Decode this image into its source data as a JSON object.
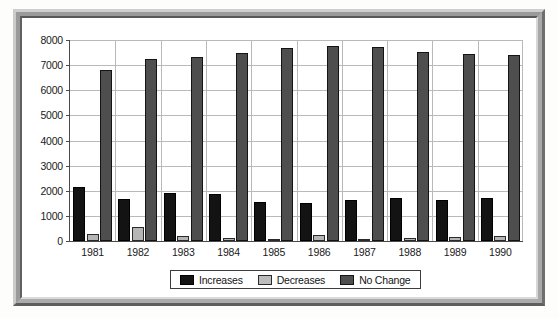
{
  "chart_data": {
    "type": "bar",
    "title": "",
    "subtitle": "",
    "xlabel": "",
    "ylabel": "",
    "ylim": [
      0,
      8000
    ],
    "ytick_step": 1000,
    "yticks": [
      "0",
      "1000",
      "2000",
      "3000",
      "4000",
      "5000",
      "6000",
      "7000",
      "8000"
    ],
    "grid": true,
    "legend_position": "bottom-center",
    "categories": [
      "1981",
      "1982",
      "1983",
      "1984",
      "1985",
      "1986",
      "1987",
      "1988",
      "1989",
      "1990"
    ],
    "series": [
      {
        "name": "Increases",
        "color": "#131313",
        "values": [
          2140,
          1670,
          1900,
          1870,
          1550,
          1500,
          1620,
          1700,
          1640,
          1700
        ]
      },
      {
        "name": "Decreases",
        "color": "#b5b5b5",
        "values": [
          270,
          550,
          180,
          130,
          100,
          250,
          80,
          120,
          150,
          180
        ]
      },
      {
        "name": "No Change",
        "color": "#4e4e4e",
        "values": [
          6820,
          7260,
          7320,
          7490,
          7690,
          7770,
          7730,
          7540,
          7440,
          7420
        ]
      }
    ]
  },
  "legend": {
    "items": [
      {
        "label": "Increases",
        "swatch": "legend-swatch-increases"
      },
      {
        "label": "Decreases",
        "swatch": "legend-swatch-decreases"
      },
      {
        "label": "No Change",
        "swatch": "legend-swatch-no-change"
      }
    ]
  },
  "colors": {
    "increases": "#131313",
    "decreases": "#b5b5b5",
    "no_change": "#4e4e4e",
    "gridline": "#b9b9b9",
    "axis": "#4a4a4a",
    "frame": "#9a9a9a",
    "background": "#ffffff"
  }
}
